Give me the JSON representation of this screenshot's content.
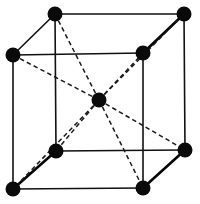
{
  "figure": {
    "background_color": "#ffffff",
    "atom_color": "#0a0a0a",
    "edge_color": "#111111",
    "diagonal_color": "#1a1a1a",
    "width": 200,
    "height": 204
  },
  "geometry": {
    "atom_radius_corner": 7.5,
    "atom_radius_center": 7.5,
    "edge_stroke_width": 1.6,
    "heavy_edge_stroke_width": 2.6,
    "diagonal_stroke_width": 1.5,
    "diagonal_dash_pattern": "4.5 3.2"
  },
  "atoms": [
    {
      "id": "front-top-left",
      "label": "Corner atom (front top left)",
      "x": 13,
      "y": 55,
      "r": 7.5,
      "role": "corner"
    },
    {
      "id": "back-top-left",
      "label": "Corner atom (back top left)",
      "x": 55,
      "y": 14,
      "r": 7.5,
      "role": "corner"
    },
    {
      "id": "back-top-right",
      "label": "Corner atom (back top right)",
      "x": 184,
      "y": 14,
      "r": 7.5,
      "role": "corner"
    },
    {
      "id": "front-top-right",
      "label": "Corner atom (front top right)",
      "x": 143,
      "y": 53,
      "r": 7.5,
      "role": "corner"
    },
    {
      "id": "front-bottom-left",
      "label": "Corner atom (front bottom left)",
      "x": 13,
      "y": 189,
      "r": 7.5,
      "role": "corner"
    },
    {
      "id": "back-bottom-left",
      "label": "Corner atom (back bottom left)",
      "x": 56,
      "y": 151,
      "r": 7.5,
      "role": "corner"
    },
    {
      "id": "back-bottom-right",
      "label": "Corner atom (back bottom right)",
      "x": 185,
      "y": 150,
      "r": 7.5,
      "role": "corner"
    },
    {
      "id": "front-bottom-right",
      "label": "Corner atom (front bottom right)",
      "x": 143,
      "y": 188,
      "r": 7.5,
      "role": "corner"
    },
    {
      "id": "body-center",
      "label": "Body-center atom",
      "x": 99,
      "y": 100,
      "r": 7.5,
      "role": "center"
    }
  ],
  "edges": [
    {
      "id": "edge-front-top",
      "from": "front-top-left",
      "to": "front-top-right",
      "style": "solid",
      "weight": "normal"
    },
    {
      "id": "edge-front-left",
      "from": "front-top-left",
      "to": "front-bottom-left",
      "style": "solid",
      "weight": "normal"
    },
    {
      "id": "edge-front-right",
      "from": "front-top-right",
      "to": "front-bottom-right",
      "style": "solid",
      "weight": "normal"
    },
    {
      "id": "edge-front-bottom",
      "from": "front-bottom-left",
      "to": "front-bottom-right",
      "style": "solid",
      "weight": "normal"
    },
    {
      "id": "edge-back-top",
      "from": "back-top-left",
      "to": "back-top-right",
      "style": "solid",
      "weight": "normal"
    },
    {
      "id": "edge-back-left",
      "from": "back-top-left",
      "to": "back-bottom-left",
      "style": "solid",
      "weight": "normal"
    },
    {
      "id": "edge-back-right",
      "from": "back-top-right",
      "to": "back-bottom-right",
      "style": "solid",
      "weight": "normal"
    },
    {
      "id": "edge-back-bottom",
      "from": "back-bottom-left",
      "to": "back-bottom-right",
      "style": "solid",
      "weight": "normal"
    },
    {
      "id": "edge-top-left-depth",
      "from": "front-top-left",
      "to": "back-top-left",
      "style": "solid",
      "weight": "normal"
    },
    {
      "id": "edge-top-right-depth",
      "from": "front-top-right",
      "to": "back-top-right",
      "style": "solid",
      "weight": "heavy"
    },
    {
      "id": "edge-bottom-left-depth",
      "from": "front-bottom-left",
      "to": "back-bottom-left",
      "style": "solid",
      "weight": "heavy"
    },
    {
      "id": "edge-bottom-right-depth",
      "from": "front-bottom-right",
      "to": "back-bottom-right",
      "style": "solid",
      "weight": "heavy"
    }
  ],
  "body_diagonals": [
    {
      "id": "diag-center-front-top-left",
      "from": "body-center",
      "to": "front-top-left",
      "style": "dashed"
    },
    {
      "id": "diag-center-back-top-left",
      "from": "body-center",
      "to": "back-top-left",
      "style": "dashed"
    },
    {
      "id": "diag-center-back-top-right",
      "from": "body-center",
      "to": "back-top-right",
      "style": "dashed"
    },
    {
      "id": "diag-center-front-top-right",
      "from": "body-center",
      "to": "front-top-right",
      "style": "dashed"
    },
    {
      "id": "diag-center-front-bottom-left",
      "from": "body-center",
      "to": "front-bottom-left",
      "style": "dashed"
    },
    {
      "id": "diag-center-back-bottom-left",
      "from": "body-center",
      "to": "back-bottom-left",
      "style": "dashed"
    },
    {
      "id": "diag-center-back-bottom-right",
      "from": "body-center",
      "to": "back-bottom-right",
      "style": "dashed"
    },
    {
      "id": "diag-center-front-bottom-right",
      "from": "body-center",
      "to": "front-bottom-right",
      "style": "dashed"
    }
  ]
}
